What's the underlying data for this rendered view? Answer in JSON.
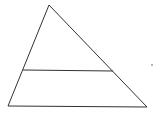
{
  "diagram": {
    "type": "triangle-with-parallel-segment",
    "stroke_color": "#333333",
    "background": "#ffffff",
    "triangle": {
      "apex": [
        49,
        5
      ],
      "bottom_left": [
        8,
        106
      ],
      "bottom_right": [
        147,
        107
      ]
    },
    "parallel_segment": {
      "left": [
        23,
        70
      ],
      "right": [
        113,
        71
      ]
    },
    "stray_mark": [
      152,
      65
    ]
  }
}
